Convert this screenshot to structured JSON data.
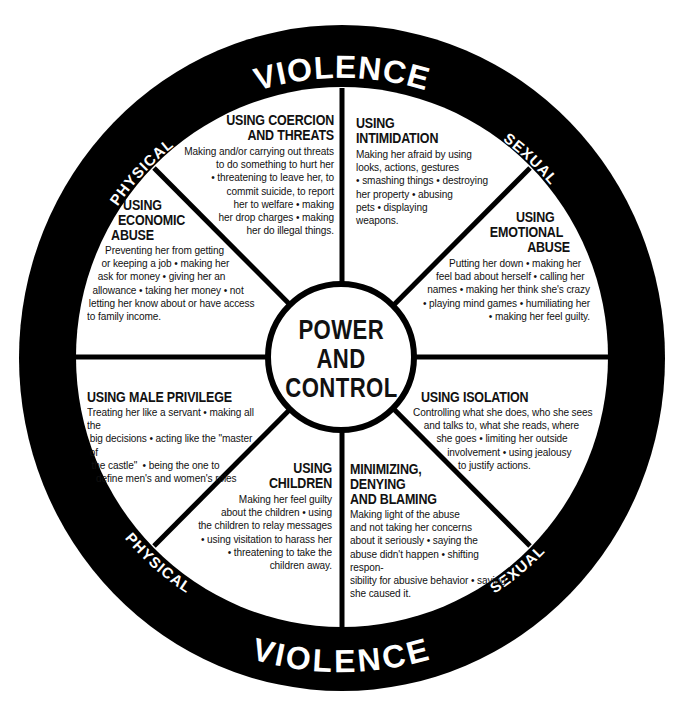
{
  "diagram": {
    "title_lines": [
      "POWER",
      "AND",
      "CONTROL"
    ],
    "outer_ring": {
      "top": {
        "left": "PHYSICAL",
        "center": "VIOLENCE",
        "right": "SEXUAL"
      },
      "bottom": {
        "left": "PHYSICAL",
        "center": "VIOLENCE",
        "right": "SEXUAL"
      }
    },
    "colors": {
      "ring": "#000000",
      "background": "#ffffff",
      "text": "#111111",
      "ring_text": "#ffffff"
    },
    "segments": [
      {
        "id": "coercion-threats",
        "title": [
          "USING COERCION",
          "AND THREATS"
        ],
        "body": [
          "Making and/or carrying out threats",
          "to do something to hurt her",
          "• threatening to leave her, to",
          "commit suicide, to report",
          "her to welfare • making",
          "her drop charges • making",
          "her do illegal things."
        ]
      },
      {
        "id": "intimidation",
        "title": [
          "USING",
          "INTIMIDATION"
        ],
        "body": [
          "Making her afraid by using",
          "looks, actions, gestures",
          "• smashing things • destroying",
          "her property • abusing",
          "pets • displaying",
          "weapons."
        ]
      },
      {
        "id": "emotional-abuse",
        "title": [
          "USING",
          "EMOTIONAL",
          "ABUSE"
        ],
        "body": [
          "Putting her down • making her",
          "feel bad about herself • calling her",
          "names • making her think she's crazy",
          "• playing mind games • humiliating her",
          "• making her feel guilty."
        ]
      },
      {
        "id": "isolation",
        "title": [
          "USING ISOLATION"
        ],
        "body": [
          "Controlling what she does, who she sees",
          "and talks to, what she reads, where",
          "she goes • limiting her outside",
          "involvement • using jealousy",
          "to justify actions."
        ]
      },
      {
        "id": "minimizing-denying-blaming",
        "title": [
          "MINIMIZING,",
          "DENYING",
          "AND BLAMING"
        ],
        "body": [
          "Making light of the abuse",
          "and not taking her concerns",
          "about it seriously • saying the",
          "abuse didn't happen • shifting respon-",
          "sibility for abusive behavior • saying",
          "she caused it."
        ]
      },
      {
        "id": "children",
        "title": [
          "USING",
          "CHILDREN"
        ],
        "body": [
          "Making her feel guilty",
          "about the children • using",
          "the children to relay messages",
          "• using visitation to harass her",
          "• threatening to take the",
          "children away."
        ]
      },
      {
        "id": "male-privilege",
        "title": [
          "USING MALE PRIVILEGE"
        ],
        "body": [
          "Treating her like a servant • making all the",
          "big decisions • acting like the \"master of",
          "the castle\"  • being the one to",
          "define men's and women's roles"
        ]
      },
      {
        "id": "economic-abuse",
        "title": [
          "USING",
          "ECONOMIC",
          "ABUSE"
        ],
        "body": [
          "Preventing her from getting",
          "or keeping a job • making her",
          "ask for money • giving her an",
          "allowance • taking her money • not",
          "letting her know about or have access",
          "to family income."
        ]
      }
    ]
  }
}
